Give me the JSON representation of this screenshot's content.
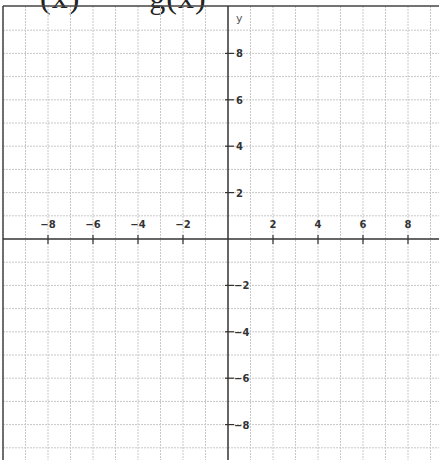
{
  "caption": {
    "left": "(x)",
    "right": "g(x)"
  },
  "chart_data": {
    "type": "line",
    "title": "",
    "xlabel": "",
    "ylabel": "y",
    "xlim": [
      -10,
      9.3
    ],
    "ylim": [
      -9,
      9.8
    ],
    "grid": true,
    "grid_step": 1,
    "x_ticks": [
      -8,
      -6,
      -4,
      -2,
      2,
      4,
      6,
      8
    ],
    "y_ticks": [
      8,
      6,
      4,
      2,
      -2,
      -4,
      -6,
      -8
    ],
    "x_tick_labels": [
      "−8",
      "−6",
      "−4",
      "−2",
      "2",
      "4",
      "6",
      "8"
    ],
    "y_tick_labels": [
      "8",
      "6",
      "4",
      "2",
      "−2",
      "−4",
      "−6",
      "−8"
    ],
    "series": []
  },
  "colors": {
    "grid": "#c8c8c8",
    "axis": "#333333",
    "border": "#444444"
  }
}
